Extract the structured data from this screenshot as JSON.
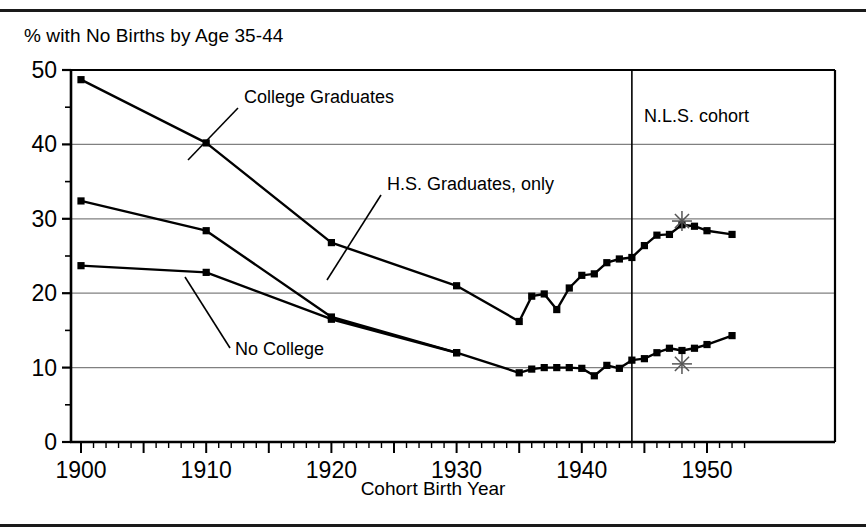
{
  "figure": {
    "y_axis_caption": "% with No Births by Age 35-44",
    "x_axis_title": "Cohort Birth Year",
    "nls_note": "N.L.S. cohort",
    "annotations": [
      {
        "name": "college-graduates-label",
        "text": "College Graduates"
      },
      {
        "name": "hs-graduates-label",
        "text": "H.S.  Graduates, only"
      },
      {
        "name": "no-college-label",
        "text": "No College"
      }
    ]
  },
  "chart_data": {
    "type": "line",
    "title": "",
    "subtitle": "",
    "xlabel": "Cohort Birth Year",
    "ylabel": "% with No Births by Age 35-44",
    "xlim": [
      1898,
      1954
    ],
    "ylim": [
      0,
      50
    ],
    "yticks": [
      0,
      10,
      20,
      30,
      40,
      50
    ],
    "yticks_minor_step": 5,
    "xticks_labeled": [
      1900,
      1910,
      1920,
      1930,
      1940,
      1950
    ],
    "xticks_major_step": 5,
    "xticks_minor_step": 1,
    "grid": "horizontal",
    "legend_position": "inline-annotations",
    "marker": "filled-square",
    "line_color": "#000000",
    "grid_color": "#808080",
    "axis_color": "#000000",
    "reference_line": {
      "name": "N.L.S. cohort divider",
      "x": 1944,
      "label": "N.L.S. cohort",
      "orientation": "vertical"
    },
    "series": [
      {
        "name": "College Graduates",
        "points": [
          [
            1900,
            48.7
          ],
          [
            1910,
            40.2
          ],
          [
            1920,
            26.8
          ],
          [
            1930,
            21.0
          ],
          [
            1935,
            16.2
          ],
          [
            1936,
            19.6
          ],
          [
            1937,
            19.9
          ],
          [
            1938,
            17.8
          ],
          [
            1939,
            20.7
          ],
          [
            1940,
            22.4
          ],
          [
            1941,
            22.6
          ],
          [
            1942,
            24.1
          ],
          [
            1943,
            24.6
          ],
          [
            1944,
            24.8
          ],
          [
            1945,
            26.4
          ],
          [
            1946,
            27.8
          ],
          [
            1947,
            27.9
          ],
          [
            1948,
            29.2
          ],
          [
            1949,
            29.0
          ],
          [
            1950,
            28.4
          ],
          [
            1952,
            27.9
          ]
        ]
      },
      {
        "name": "H.S. Graduates, only",
        "points": [
          [
            1900,
            32.4
          ],
          [
            1910,
            28.4
          ],
          [
            1920,
            16.8
          ],
          [
            1930,
            12.0
          ]
        ]
      },
      {
        "name": "No College",
        "points": [
          [
            1900,
            23.7
          ],
          [
            1910,
            22.8
          ],
          [
            1920,
            16.5
          ],
          [
            1930,
            12.0
          ],
          [
            1935,
            9.3
          ],
          [
            1936,
            9.8
          ],
          [
            1937,
            10.0
          ],
          [
            1938,
            10.0
          ],
          [
            1939,
            10.0
          ],
          [
            1940,
            9.9
          ],
          [
            1941,
            8.9
          ],
          [
            1942,
            10.3
          ],
          [
            1943,
            9.9
          ],
          [
            1944,
            11.0
          ],
          [
            1945,
            11.2
          ],
          [
            1946,
            12.0
          ],
          [
            1947,
            12.6
          ],
          [
            1948,
            12.3
          ],
          [
            1949,
            12.6
          ],
          [
            1950,
            13.1
          ],
          [
            1952,
            14.3
          ]
        ]
      }
    ],
    "special_markers": [
      {
        "name": "asterisk-college",
        "x": 1948,
        "y": 29.7,
        "glyph": "asterisk"
      },
      {
        "name": "asterisk-no-college",
        "x": 1948,
        "y": 10.5,
        "glyph": "asterisk"
      }
    ]
  }
}
